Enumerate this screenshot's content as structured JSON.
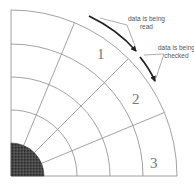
{
  "diagram": {
    "origin": {
      "x": 11,
      "y": 176
    },
    "hub_radius": 33,
    "track_radii": [
      66,
      99,
      132,
      166
    ],
    "radial_angles_deg": [
      22.5,
      45,
      67.5
    ],
    "colors": {
      "grid_line": "#8a8a8a",
      "hub_fill": "#3a3a3a",
      "arrow": "#222222",
      "leader": "#777777"
    },
    "sectors": [
      {
        "label": "1",
        "x": 97,
        "y": 47
      },
      {
        "label": "2",
        "x": 132,
        "y": 92
      },
      {
        "label": "3",
        "x": 150,
        "y": 156
      }
    ],
    "annotations": [
      {
        "line1": "data is being",
        "line2": "read",
        "x": 127,
        "y": 15
      },
      {
        "line1": "data is being",
        "line2": "checked",
        "x": 159,
        "y": 45
      }
    ]
  }
}
